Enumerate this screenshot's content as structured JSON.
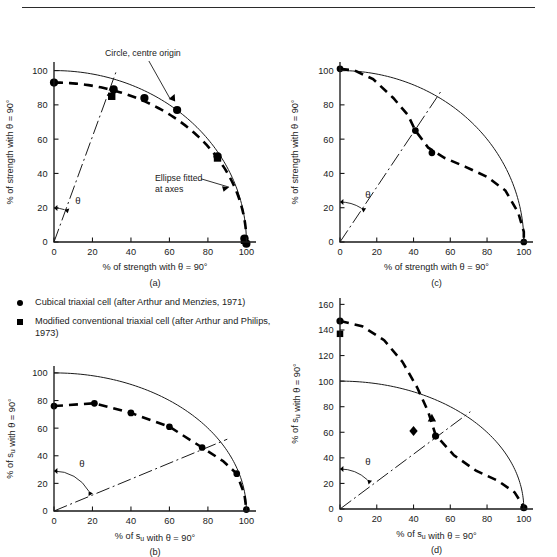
{
  "figure": {
    "top_rule": true,
    "legend": {
      "items": [
        {
          "marker": "circle",
          "label": "Cubical triaxial cell (after Arthur and Menzies, 1971)"
        },
        {
          "marker": "square",
          "label": "Modified conventional triaxial cell (after Arthur and Philips, 1973)"
        }
      ]
    }
  },
  "chart_data": [
    {
      "id": "a",
      "type": "scatter",
      "panel_label": "(a)",
      "xlabel": "% of strength with θ = 90°",
      "ylabel": "% of strength with θ = 90°",
      "xlim": [
        0,
        105
      ],
      "ylim": [
        0,
        105
      ],
      "xticks": [
        0,
        20,
        40,
        60,
        80,
        100
      ],
      "yticks": [
        0,
        20,
        40,
        60,
        80,
        100
      ],
      "xticklabels": [
        "0",
        "20",
        "40",
        "60",
        "80",
        "100"
      ],
      "yticklabels": [
        "0",
        "20",
        "40",
        "60",
        "80",
        "100"
      ],
      "grid": false,
      "reference_circle": {
        "radius": 100,
        "label": "Circle, centre origin"
      },
      "fitted_ellipse": {
        "a": 100,
        "b": 93,
        "label": "Ellipse fitted\nat axes"
      },
      "theta_symbol": "θ",
      "theta_ray_deg": 72,
      "series": [
        {
          "name": "Cubical triaxial cell (after Arthur and Menzies, 1971)",
          "marker": "circle",
          "points": [
            [
              0,
              93
            ],
            [
              31,
              89
            ],
            [
              47,
              84
            ],
            [
              64,
              77
            ],
            [
              85,
              50
            ],
            [
              99,
              2
            ],
            [
              100,
              -1
            ]
          ]
        },
        {
          "name": "Modified conventional triaxial cell (after Arthur and Philips, 1973)",
          "marker": "square",
          "points": [
            [
              30,
              85
            ],
            [
              85,
              49
            ],
            [
              99,
              1
            ]
          ]
        }
      ]
    },
    {
      "id": "c",
      "type": "scatter",
      "panel_label": "(c)",
      "xlabel": "% of strength with θ = 90°",
      "ylabel": "% of strength with θ = 90°",
      "xlim": [
        0,
        105
      ],
      "ylim": [
        0,
        105
      ],
      "xticks": [
        0,
        20,
        40,
        60,
        80,
        100
      ],
      "yticks": [
        0,
        20,
        40,
        60,
        80,
        100
      ],
      "xticklabels": [
        "0",
        "20",
        "40",
        "60",
        "80",
        "100"
      ],
      "yticklabels": [
        "0",
        "20",
        "40",
        "60",
        "80",
        "100"
      ],
      "grid": false,
      "reference_circle": {
        "radius": 100
      },
      "theta_symbol": "θ",
      "theta_ray_deg": 58,
      "fitted_path": [
        [
          0,
          101
        ],
        [
          8,
          100
        ],
        [
          18,
          95
        ],
        [
          29,
          84
        ],
        [
          37,
          74
        ],
        [
          41,
          65
        ],
        [
          48,
          55
        ],
        [
          57,
          49
        ],
        [
          68,
          44
        ],
        [
          80,
          38
        ],
        [
          90,
          30
        ],
        [
          97,
          17
        ],
        [
          100,
          6
        ],
        [
          100,
          0
        ]
      ],
      "series": [
        {
          "name": "Cubical triaxial cell (after Arthur and Menzies, 1971)",
          "marker": "circle",
          "points": [
            [
              0,
              101
            ],
            [
              41,
              65
            ],
            [
              50,
              52
            ],
            [
              100,
              0
            ]
          ]
        }
      ]
    },
    {
      "id": "b",
      "type": "scatter",
      "panel_label": "(b)",
      "xlabel": "% of s<sub>u</sub> with θ = 90°",
      "ylabel": "% of s<sub>u</sub> with θ = 90°",
      "xlim": [
        0,
        105
      ],
      "ylim": [
        0,
        105
      ],
      "xticks": [
        0,
        20,
        40,
        60,
        80,
        100
      ],
      "yticks": [
        0,
        20,
        40,
        60,
        80,
        100
      ],
      "xticklabels": [
        "0",
        "20",
        "40",
        "60",
        "80",
        "100"
      ],
      "yticklabels": [
        "0",
        "20",
        "40",
        "60",
        "80",
        "100"
      ],
      "grid": false,
      "reference_circle": {
        "radius": 100
      },
      "theta_symbol": "θ",
      "theta_ray_deg": 30,
      "fitted_path": [
        [
          0,
          76
        ],
        [
          21,
          78
        ],
        [
          40,
          71
        ],
        [
          60,
          61
        ],
        [
          77,
          46
        ],
        [
          88,
          36
        ],
        [
          95,
          27
        ],
        [
          99,
          12
        ],
        [
          100,
          1
        ]
      ],
      "series": [
        {
          "name": "Cubical triaxial cell (after Arthur and Menzies, 1971)",
          "marker": "circle",
          "points": [
            [
              0,
              76
            ],
            [
              21,
              78
            ],
            [
              40,
              71
            ],
            [
              60,
              61
            ],
            [
              77,
              46
            ],
            [
              95,
              27
            ],
            [
              100,
              1
            ]
          ]
        }
      ]
    },
    {
      "id": "d",
      "type": "scatter",
      "panel_label": "(d)",
      "xlabel": "% of s<sub>u</sub> with θ = 90°",
      "ylabel": "% of s<sub>u</sub> with θ = 90°",
      "xlim": [
        0,
        105
      ],
      "ylim": [
        0,
        165
      ],
      "xticks": [
        0,
        20,
        40,
        60,
        80,
        100
      ],
      "yticks": [
        0,
        20,
        40,
        60,
        80,
        100,
        120,
        140,
        160
      ],
      "xticklabels": [
        "0",
        "20",
        "40",
        "60",
        "80",
        "100"
      ],
      "yticklabels": [
        "0",
        "20",
        "40",
        "60",
        "80",
        "100",
        "120",
        "140",
        "160"
      ],
      "grid": false,
      "reference_circle": {
        "radius": 100
      },
      "theta_symbol": "θ",
      "theta_ray_deg": 47,
      "fitted_path": [
        [
          0,
          147
        ],
        [
          12,
          143
        ],
        [
          24,
          132
        ],
        [
          34,
          115
        ],
        [
          42,
          95
        ],
        [
          48,
          76
        ],
        [
          52,
          58
        ],
        [
          62,
          42
        ],
        [
          74,
          30
        ],
        [
          86,
          22
        ],
        [
          95,
          13
        ],
        [
          99,
          4
        ],
        [
          100,
          0
        ]
      ],
      "series": [
        {
          "name": "circle-series",
          "marker": "circle",
          "points": [
            [
              0,
              147
            ],
            [
              52,
              57
            ],
            [
              100,
              1
            ]
          ]
        },
        {
          "name": "square-series",
          "marker": "square",
          "points": [
            [
              0,
              137
            ]
          ]
        },
        {
          "name": "triangle-series",
          "marker": "triangle",
          "points": [
            [
              50,
              71
            ]
          ]
        },
        {
          "name": "diamond-series",
          "marker": "diamond",
          "points": [
            [
              40,
              61
            ]
          ]
        }
      ]
    }
  ]
}
